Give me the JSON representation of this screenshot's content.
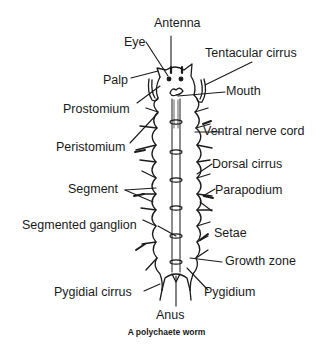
{
  "diagram": {
    "caption": "A polychaete worm",
    "labels": {
      "antenna": "Antenna",
      "eye": "Eye",
      "tentacular_cirrus": "Tentacular cirrus",
      "palp": "Palp",
      "mouth": "Mouth",
      "prostomium": "Prostomium",
      "ventral_nerve_cord": "Ventral nerve cord",
      "peristomium": "Peristomium",
      "dorsal_cirrus": "Dorsal cirrus",
      "segment": "Segment",
      "parapodium": "Parapodium",
      "segmented_ganglion": "Segmented ganglion",
      "setae": "Setae",
      "growth_zone": "Growth zone",
      "pygidial_cirrus": "Pygidial cirrus",
      "pygidium": "Pygidium",
      "anus": "Anus"
    },
    "colors": {
      "ink": "#1a1a1a",
      "background": "#ffffff"
    }
  }
}
